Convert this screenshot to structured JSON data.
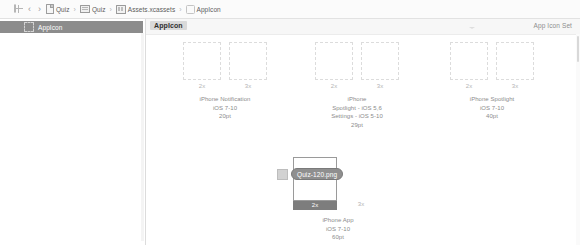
{
  "jumpbar": {
    "grid_icon": "grid-icon",
    "back_label": "‹",
    "forward_label": "›",
    "separator": "›",
    "items": [
      {
        "icon": "document-icon",
        "label": "Quiz"
      },
      {
        "icon": "folder-icon",
        "label": "Quiz"
      },
      {
        "icon": "asset-catalog-icon",
        "label": "Assets.xcassets"
      },
      {
        "icon": "image-set-icon",
        "label": "AppIcon"
      }
    ]
  },
  "sidebar": {
    "selected_item": {
      "icon": "appicon-set-icon",
      "label": "AppIcon"
    }
  },
  "editor": {
    "title": "AppIcon",
    "kind": "App Icon Set",
    "groups": [
      {
        "name": "iphone-notification",
        "caption": "iPhone Notification\niOS 7-10\n20pt",
        "caption_lines": [
          "iPhone Notification",
          "iOS 7-10",
          "20pt"
        ],
        "slots": [
          {
            "scale": "2x",
            "filled": false
          },
          {
            "scale": "3x",
            "filled": false
          }
        ]
      },
      {
        "name": "iphone-spotlight-settings",
        "caption_lines": [
          "iPhone",
          "Spotlight - iOS 5,6",
          "Settings - iOS 5-10",
          "29pt"
        ],
        "slots": [
          {
            "scale": "2x",
            "filled": false
          },
          {
            "scale": "3x",
            "filled": false
          }
        ]
      },
      {
        "name": "iphone-spotlight",
        "caption_lines": [
          "iPhone Spotlight",
          "iOS 7-10",
          "40pt"
        ],
        "slots": [
          {
            "scale": "2x",
            "filled": false
          },
          {
            "scale": "3x",
            "filled": false
          }
        ]
      },
      {
        "name": "iphone-app",
        "caption_lines": [
          "iPhone App",
          "iOS 7-10",
          "60pt"
        ],
        "slots": [
          {
            "scale": "2x",
            "filled": false,
            "drop_target": true
          },
          {
            "scale": "3x",
            "filled": false
          }
        ]
      }
    ]
  },
  "drag": {
    "filename": "Quiz-120.png",
    "thumb_icon": "image-thumbnail-icon"
  },
  "colors": {
    "selection": "#8c8c8c",
    "drop_badge": "#7d7d7d",
    "drag_pill": "#8f8f8f",
    "title_badge": "#d9d9d9",
    "well_border": "#dcdcdc"
  }
}
